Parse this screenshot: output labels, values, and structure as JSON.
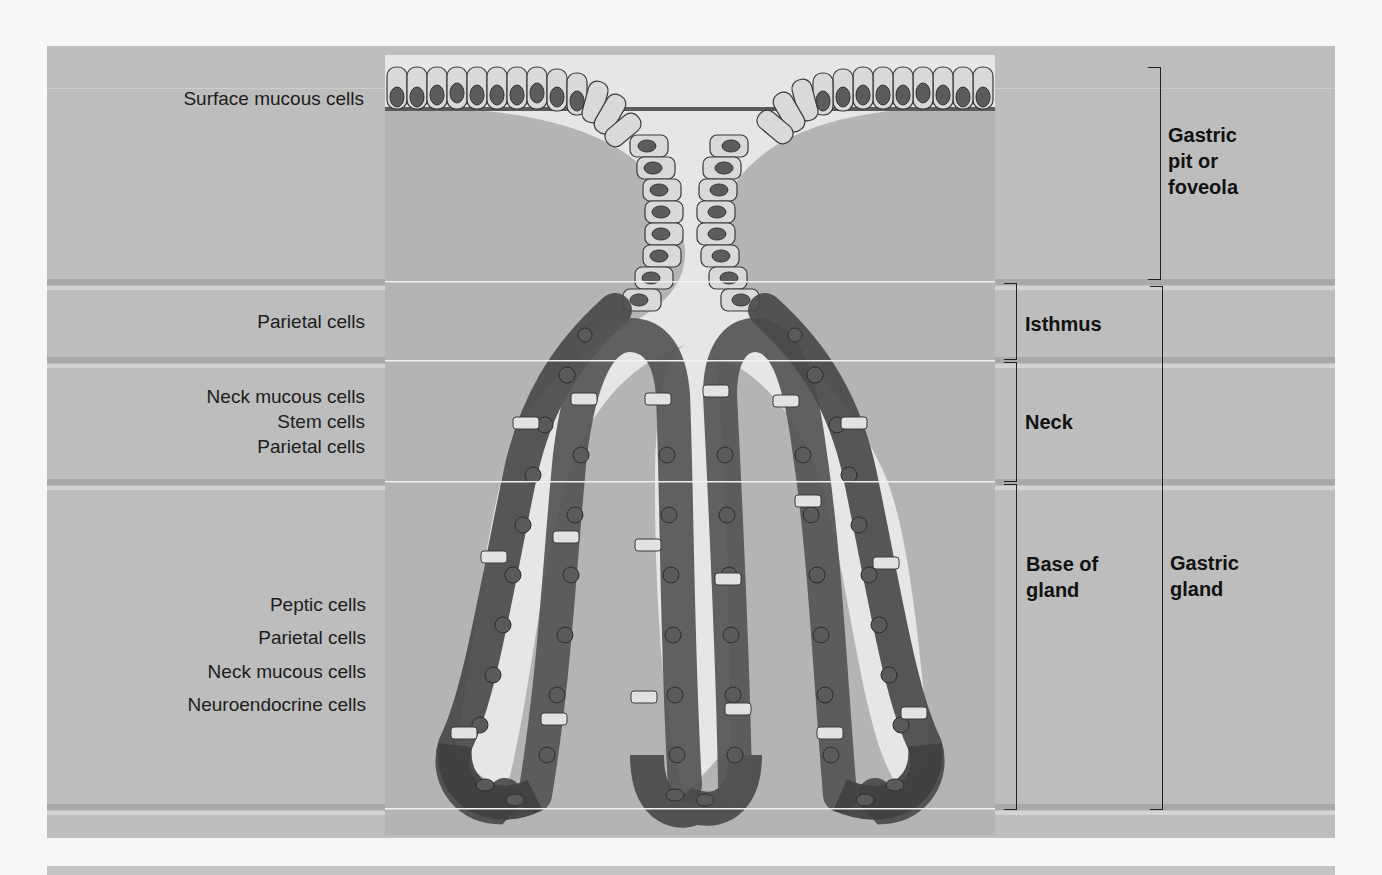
{
  "figure": {
    "colors": {
      "background": "#bdbdbd",
      "lumen": "#e8e8e8",
      "mucous_cell": "#d8d8d8",
      "parietal_cell": "#6e6e6e",
      "peptic_cell": "#4a4a4a",
      "nucleus": "#555555"
    }
  },
  "left_labels": {
    "pit": [
      "Surface mucous cells"
    ],
    "isthmus": [
      "Parietal cells"
    ],
    "neck": [
      "Neck mucous cells",
      "Stem cells",
      "Parietal cells"
    ],
    "base": [
      "Peptic cells",
      "Parietal cells",
      "Neck mucous cells",
      "Neuroendocrine cells"
    ]
  },
  "right_labels": {
    "region_inner": {
      "isthmus": "Isthmus",
      "neck": "Neck",
      "base_line1": "Base of",
      "base_line2": "gland"
    },
    "region_outer": {
      "pit_line1": "Gastric",
      "pit_line2": "pit or",
      "pit_line3": "foveola",
      "gland_line1": "Gastric",
      "gland_line2": "gland"
    }
  }
}
